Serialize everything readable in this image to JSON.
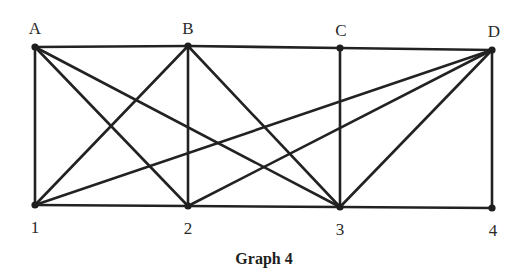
{
  "diagram": {
    "type": "graph",
    "caption": "Graph 4",
    "nodes": [
      {
        "id": "A",
        "label": "A",
        "x": 35,
        "y": 47,
        "label_x": 35,
        "label_y": 34
      },
      {
        "id": "B",
        "label": "B",
        "x": 188,
        "y": 46,
        "label_x": 188,
        "label_y": 34
      },
      {
        "id": "C",
        "label": "C",
        "x": 340,
        "y": 48,
        "label_x": 341,
        "label_y": 36
      },
      {
        "id": "D",
        "label": "D",
        "x": 492,
        "y": 50,
        "label_x": 494,
        "label_y": 37
      },
      {
        "id": "1",
        "label": "1",
        "x": 35,
        "y": 205,
        "label_x": 35,
        "label_y": 233
      },
      {
        "id": "2",
        "label": "2",
        "x": 188,
        "y": 206,
        "label_x": 188,
        "label_y": 234
      },
      {
        "id": "3",
        "label": "3",
        "x": 340,
        "y": 207,
        "label_x": 340,
        "label_y": 235
      },
      {
        "id": "4",
        "label": "4",
        "x": 492,
        "y": 208,
        "label_x": 493,
        "label_y": 236
      }
    ],
    "edges": [
      [
        "A",
        "B"
      ],
      [
        "B",
        "C"
      ],
      [
        "C",
        "D"
      ],
      [
        "1",
        "2"
      ],
      [
        "2",
        "3"
      ],
      [
        "3",
        "4"
      ],
      [
        "A",
        "1"
      ],
      [
        "B",
        "2"
      ],
      [
        "C",
        "3"
      ],
      [
        "D",
        "4"
      ],
      [
        "A",
        "2"
      ],
      [
        "A",
        "3"
      ],
      [
        "B",
        "1"
      ],
      [
        "B",
        "3"
      ],
      [
        "D",
        "1"
      ],
      [
        "D",
        "2"
      ],
      [
        "D",
        "3"
      ]
    ],
    "caption_position": {
      "x": 264,
      "y": 264
    },
    "colors": {
      "edge": "#222222",
      "node": "#1e1e1e",
      "label": "#2a2a2a",
      "background": "#ffffff"
    }
  }
}
